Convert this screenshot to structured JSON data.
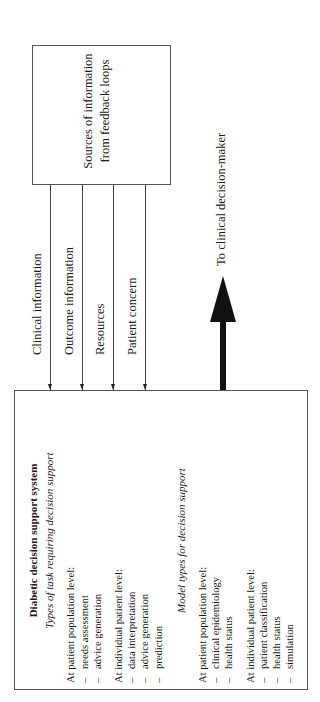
{
  "diagram": {
    "source_box": {
      "lines": [
        "Sources of information",
        "from feedback loops"
      ]
    },
    "feedback_flows": [
      {
        "label": "Clinical information",
        "direction": "to-decision-support-system"
      },
      {
        "label": "Outcome information",
        "direction": "to-decision-support-system"
      },
      {
        "label": "Resources",
        "direction": "to-decision-support-system"
      },
      {
        "label": "Patient concern",
        "direction": "to-decision-support-system"
      }
    ],
    "output_arrow": {
      "label": "To clinical decision-maker"
    },
    "dss_box": {
      "title": "Diabetic decision support system",
      "section1": {
        "heading": "Types of task requiring decision support",
        "groups": [
          {
            "label": "At patient population level:",
            "items": [
              "needs assessment",
              "advice generation"
            ]
          },
          {
            "label": "At individual patient level:",
            "items": [
              "data interpretation",
              "advice generation",
              "prediction"
            ]
          }
        ]
      },
      "section2": {
        "heading": "Model types for decision support",
        "groups": [
          {
            "label": "At patient population level:",
            "items": [
              "clinical epidemiology",
              "health status"
            ]
          },
          {
            "label": "At individual patient level:",
            "items": [
              "patient classification",
              "health status",
              "simulation"
            ]
          }
        ]
      }
    },
    "dash": "–"
  }
}
